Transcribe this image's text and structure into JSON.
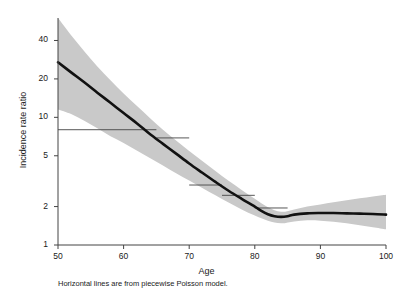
{
  "figure": {
    "background": "#ffffff",
    "caption": "Horizontal lines are from piecewise Poisson model."
  },
  "chart_data": {
    "type": "line",
    "title": "",
    "subtitle": "",
    "xlabel": "Age",
    "ylabel": "Incidence rate ratio",
    "yscale": "log",
    "xscale": "linear",
    "xlim": [
      50,
      100
    ],
    "ylim": [
      1,
      60
    ],
    "grid": false,
    "legend": false,
    "legend_position": "none",
    "xticks": [
      50,
      60,
      70,
      80,
      90,
      100
    ],
    "xtick_labels": [
      "50",
      "60",
      "70",
      "80",
      "90",
      "100"
    ],
    "yticks": [
      1,
      2,
      5,
      10,
      20,
      40
    ],
    "ytick_labels": [
      "1",
      "2",
      "5",
      "10",
      "20",
      "40"
    ],
    "series": [
      {
        "name": "Smoothed incidence rate ratio",
        "type": "line",
        "color": "#111111",
        "linewidth": 2.6,
        "x": [
          50,
          52,
          54,
          56,
          58,
          60,
          62,
          64,
          66,
          68,
          70,
          72,
          74,
          76,
          78,
          80,
          81,
          82,
          83,
          84,
          85,
          86,
          88,
          90,
          92,
          94,
          96,
          98,
          100
        ],
        "y": [
          27.0,
          22.5,
          18.8,
          15.6,
          13.0,
          10.8,
          9.0,
          7.4,
          6.2,
          5.2,
          4.35,
          3.68,
          3.12,
          2.66,
          2.3,
          2.0,
          1.85,
          1.74,
          1.68,
          1.66,
          1.68,
          1.73,
          1.77,
          1.78,
          1.78,
          1.77,
          1.76,
          1.75,
          1.73
        ]
      },
      {
        "name": "95% confidence band",
        "type": "area",
        "color": "#c9c9c9",
        "x": [
          50,
          52,
          54,
          56,
          58,
          60,
          62,
          64,
          66,
          68,
          70,
          72,
          74,
          76,
          78,
          80,
          82,
          84,
          86,
          88,
          90,
          92,
          94,
          96,
          98,
          100
        ],
        "y_upper": [
          60.0,
          44.0,
          33.0,
          25.0,
          19.5,
          15.4,
          12.3,
          9.9,
          8.0,
          6.6,
          5.45,
          4.55,
          3.8,
          3.18,
          2.7,
          2.3,
          1.98,
          1.82,
          1.9,
          2.0,
          2.08,
          2.16,
          2.24,
          2.32,
          2.4,
          2.48
        ],
        "y_lower": [
          11.5,
          10.6,
          9.4,
          8.2,
          7.1,
          6.3,
          5.5,
          4.8,
          4.2,
          3.65,
          3.2,
          2.8,
          2.45,
          2.15,
          1.9,
          1.7,
          1.55,
          1.48,
          1.53,
          1.56,
          1.55,
          1.52,
          1.48,
          1.43,
          1.38,
          1.33
        ]
      },
      {
        "name": "Piecewise Poisson model estimates",
        "type": "segments",
        "color": "#444444",
        "linewidth": 0.9,
        "segments": [
          {
            "x_start": 50,
            "x_end": 65,
            "y": 8.0
          },
          {
            "x_start": 65,
            "x_end": 70,
            "y": 6.9
          },
          {
            "x_start": 70,
            "x_end": 75,
            "y": 2.95
          },
          {
            "x_start": 75,
            "x_end": 80,
            "y": 2.45
          },
          {
            "x_start": 80,
            "x_end": 85,
            "y": 1.95
          }
        ]
      }
    ]
  }
}
